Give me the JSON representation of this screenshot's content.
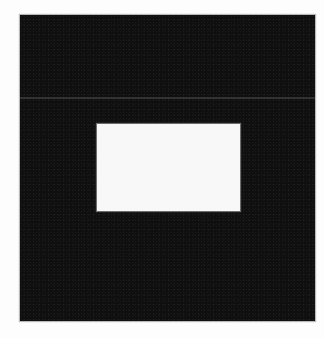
{
  "image": {
    "description": "Grayscale photo of a dark square with a white rectangle near its center",
    "colors": {
      "background": "#fdfdfd",
      "square": "#0f0f0f",
      "rectangle": "#f8f8f8",
      "band": "#5a5a5a"
    }
  }
}
